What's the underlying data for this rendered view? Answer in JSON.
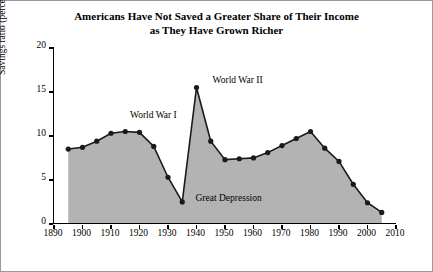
{
  "title": {
    "line1": "Americans Have Not Saved a Greater Share of Their Income",
    "line2": "as They Have Grown Richer"
  },
  "chart_data": {
    "type": "line",
    "title": "Americans Have Not Saved a Greater Share of Their Income as They Have Grown Richer",
    "xlabel": "",
    "ylabel": "Savings ratio (percent)",
    "xlim": [
      1890,
      2010
    ],
    "ylim": [
      0,
      20
    ],
    "yticks": [
      0,
      5,
      10,
      15,
      20
    ],
    "xticks": [
      1890,
      1900,
      1910,
      1920,
      1930,
      1940,
      1950,
      1960,
      1970,
      1980,
      1990,
      2000,
      2010
    ],
    "grid": false,
    "legend": null,
    "area_fill": "#b3b3b3",
    "line_color": "#1a1a1a",
    "marker": "filled-circle",
    "x": [
      1895,
      1900,
      1905,
      1910,
      1915,
      1920,
      1925,
      1930,
      1935,
      1940,
      1945,
      1950,
      1955,
      1960,
      1965,
      1970,
      1975,
      1980,
      1985,
      1990,
      1995,
      2000,
      2005
    ],
    "values": [
      8.4,
      8.6,
      9.3,
      10.2,
      10.4,
      10.3,
      8.7,
      5.2,
      2.4,
      15.4,
      9.3,
      7.2,
      7.3,
      7.4,
      8.0,
      8.8,
      9.6,
      10.4,
      8.5,
      7.0,
      4.4,
      2.3,
      1.2
    ],
    "annotations": [
      {
        "text": "World War I",
        "x": 1917,
        "y": 12.1
      },
      {
        "text": "World War II",
        "x": 1946,
        "y": 16.0
      },
      {
        "text": "Great Depression",
        "x": 1940,
        "y": 2.6
      }
    ]
  }
}
